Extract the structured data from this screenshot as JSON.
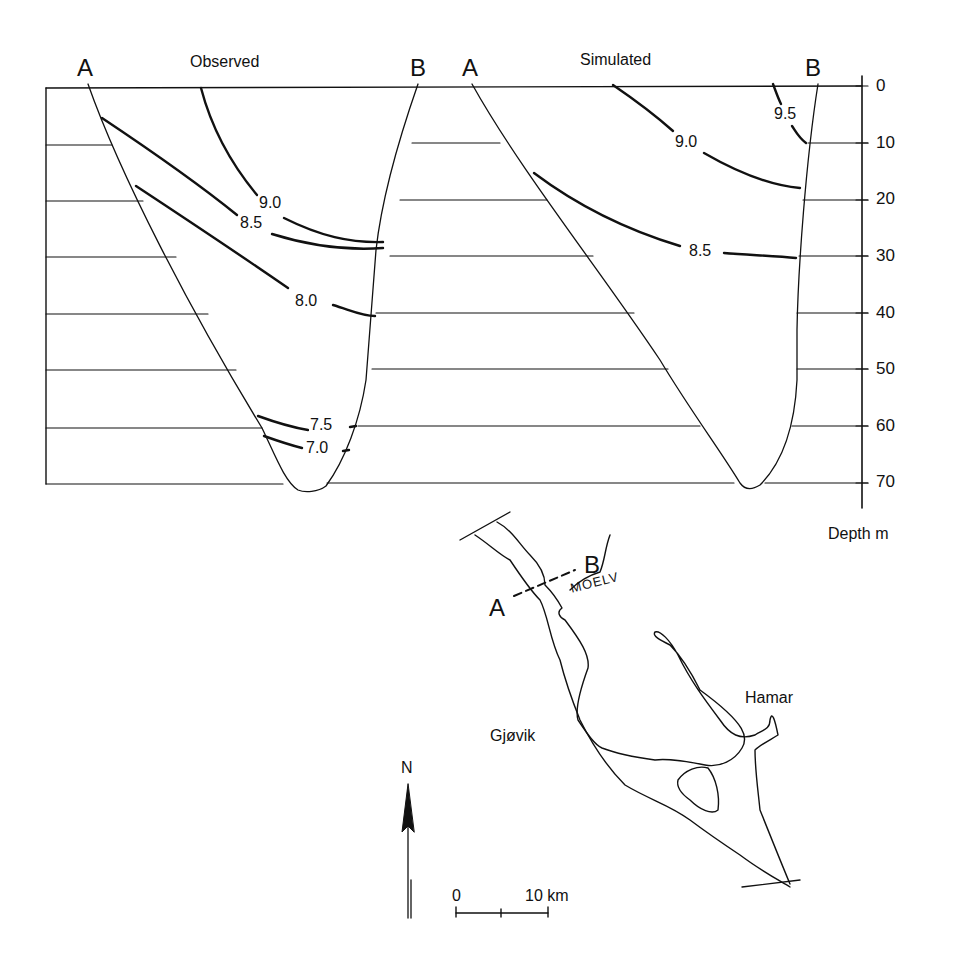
{
  "panels": [
    {
      "id": "observed",
      "title": "Observed",
      "end_a": "A",
      "end_b": "B",
      "isotherms": [
        {
          "value": "9.0",
          "label": "9.0"
        },
        {
          "value": "8.5",
          "label": "8.5"
        },
        {
          "value": "8.0",
          "label": "8.0"
        },
        {
          "value": "7.5",
          "label": "7.5"
        },
        {
          "value": "7.0",
          "label": "7.0"
        }
      ],
      "max_depth_m": 72
    },
    {
      "id": "simulated",
      "title": "Simulated",
      "end_a": "A",
      "end_b": "B",
      "isotherms": [
        {
          "value": "9.5",
          "label": "9.5"
        },
        {
          "value": "9.0",
          "label": "9.0"
        },
        {
          "value": "8.5",
          "label": "8.5"
        }
      ],
      "max_depth_m": 72
    }
  ],
  "depth_axis": {
    "label": "Depth m",
    "ticks": [
      "0",
      "10",
      "20",
      "30",
      "40",
      "50",
      "60",
      "70"
    ]
  },
  "map": {
    "section_a": "A",
    "section_b": "B",
    "places": {
      "moelv": "MOELV",
      "hamar": "Hamar",
      "gjovik": "Gjøvik"
    },
    "north_label": "N",
    "scale": {
      "zero": "0",
      "ten": "10 km"
    }
  },
  "colors": {
    "ink": "#111111",
    "background": "#ffffff"
  }
}
